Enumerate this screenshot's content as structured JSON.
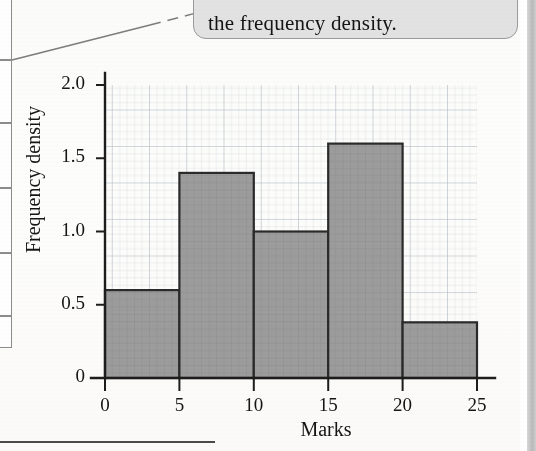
{
  "callout": {
    "text": "the frequency density."
  },
  "chart_data": {
    "type": "bar",
    "title": "",
    "subtitle": "",
    "xlabel": "Marks",
    "ylabel": "Frequency density",
    "xlim": [
      0,
      25
    ],
    "ylim": [
      0,
      2.0
    ],
    "grid": true,
    "grid_style": "graph-paper fine squares with heavier line every 5 squares",
    "legend": "none",
    "bar_fill_color": "#9a9a9a",
    "bar_edge_color": "#2a2a2a",
    "xticks": [
      "0",
      "5",
      "10",
      "15",
      "20",
      "25"
    ],
    "xtick_values": [
      0,
      5,
      10,
      15,
      20,
      25
    ],
    "yticks": [
      "0",
      "0.5",
      "1.0",
      "1.5",
      "2.0"
    ],
    "ytick_values": [
      0,
      0.5,
      1.0,
      1.5,
      2.0
    ],
    "categories": [
      "0-5",
      "5-10",
      "10-15",
      "15-20",
      "20-25"
    ],
    "bin_edges": [
      0,
      5,
      10,
      15,
      20,
      25
    ],
    "values": [
      0.6,
      1.4,
      1.0,
      1.6,
      0.38
    ],
    "bars": [
      {
        "label": "0-5",
        "x_start": 0,
        "x_end": 5,
        "frequency_density": 0.6
      },
      {
        "label": "5-10",
        "x_start": 5,
        "x_end": 10,
        "frequency_density": 1.4
      },
      {
        "label": "10-15",
        "x_start": 10,
        "x_end": 15,
        "frequency_density": 1.0
      },
      {
        "label": "15-20",
        "x_start": 15,
        "x_end": 20,
        "frequency_density": 1.6
      },
      {
        "label": "20-25",
        "x_start": 20,
        "x_end": 25,
        "frequency_density": 0.38
      }
    ]
  },
  "left_table": {
    "visible_rows": 5
  }
}
